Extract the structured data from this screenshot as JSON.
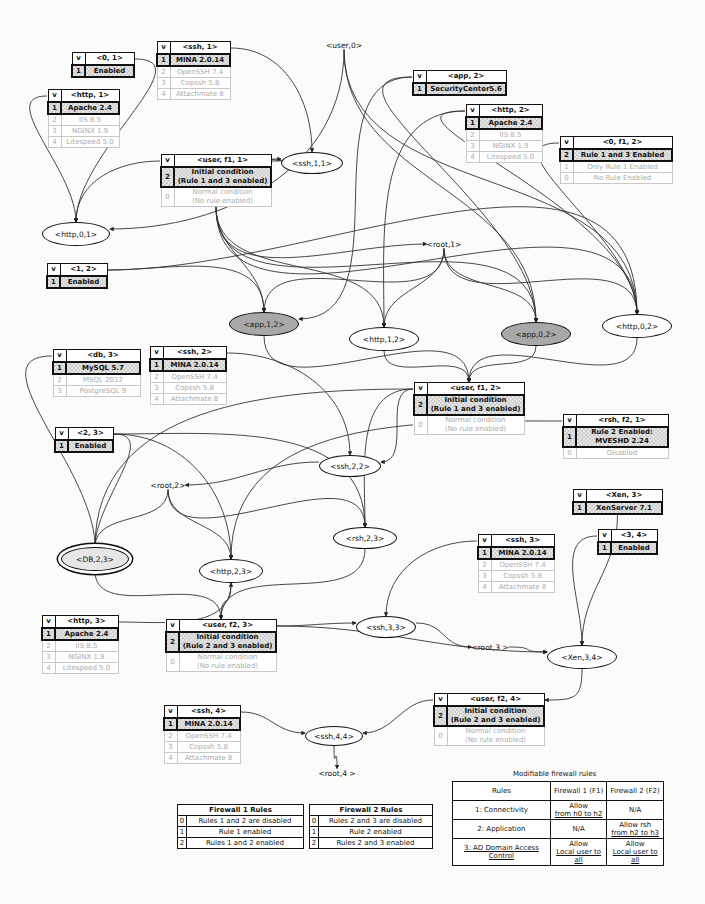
{
  "condition_tables": [
    {
      "id": "t01",
      "header": "<0, 1>",
      "x": 71,
      "y": 52,
      "w": 64,
      "rows": [
        {
          "idx": "1",
          "text": "Enabled",
          "selected": true
        }
      ]
    },
    {
      "id": "thttp1",
      "header": "<http, 1>",
      "x": 47,
      "y": 89,
      "w": 73,
      "rows": [
        {
          "idx": "1",
          "text": "Apache 2.4",
          "selected": true
        },
        {
          "idx": "2",
          "text": "IIS 8.5"
        },
        {
          "idx": "3",
          "text": "NGINX 1.9"
        },
        {
          "idx": "4",
          "text": "Litespeed 5.0"
        }
      ]
    },
    {
      "id": "tssh1",
      "header": "<ssh, 1>",
      "x": 156,
      "y": 41,
      "w": 75,
      "rows": [
        {
          "idx": "1",
          "text": "MINA 2.0.14",
          "selected": true
        },
        {
          "idx": "2",
          "text": "OpenSSH 7.4"
        },
        {
          "idx": "3",
          "text": "Copssh 5.8"
        },
        {
          "idx": "4",
          "text": "Attachmate 8"
        }
      ]
    },
    {
      "id": "tuserf11",
      "header": "<user, f1, 1>",
      "x": 160,
      "y": 154,
      "w": 112,
      "rows": [
        {
          "idx": "2",
          "text": "Initial condition\n(Rule 1 and 3 enabled)",
          "selected": true,
          "two": true
        },
        {
          "idx": "0",
          "text": "Normal condition\n(No rule enabled)",
          "two": true
        }
      ]
    },
    {
      "id": "tapp2",
      "header": "<app, 2>",
      "x": 412,
      "y": 70,
      "w": 95,
      "rows": [
        {
          "idx": "1",
          "text": "SecurityCenter5.6",
          "selected": true
        }
      ]
    },
    {
      "id": "thttp2",
      "header": "<http, 2>",
      "x": 465,
      "y": 104,
      "w": 78,
      "rows": [
        {
          "idx": "1",
          "text": "Apache 2.4",
          "selected": true
        },
        {
          "idx": "2",
          "text": "IIS 8.5"
        },
        {
          "idx": "3",
          "text": "NGINX 1.9"
        },
        {
          "idx": "4",
          "text": "Litespeed 5.0"
        }
      ]
    },
    {
      "id": "t0f12",
      "header": "<0, f1, 2>",
      "x": 559,
      "y": 136,
      "w": 114,
      "rows": [
        {
          "idx": "2",
          "text": "Rule 1 and 3 Enabled",
          "selected": true
        },
        {
          "idx": "1",
          "text": "Only Rule 1 Enabled"
        },
        {
          "idx": "0",
          "text": "No Rule Enabled"
        }
      ]
    },
    {
      "id": "t12",
      "header": "<1, 2>",
      "x": 46,
      "y": 263,
      "w": 62,
      "rows": [
        {
          "idx": "1",
          "text": "Enabled",
          "selected": true
        }
      ]
    },
    {
      "id": "tdb3",
      "header": "<db, 3>",
      "x": 52,
      "y": 349,
      "w": 89,
      "rows": [
        {
          "idx": "1",
          "text": "MySQL 5.7",
          "selected": true
        },
        {
          "idx": "2",
          "text": "MSQL 2012"
        },
        {
          "idx": "3",
          "text": "PostgreSQL 9"
        }
      ]
    },
    {
      "id": "tssh2",
      "header": "<ssh, 2>",
      "x": 149,
      "y": 346,
      "w": 78,
      "rows": [
        {
          "idx": "1",
          "text": "MINA 2.0.14",
          "selected": true
        },
        {
          "idx": "2",
          "text": "OpenSSH 7.4"
        },
        {
          "idx": "3",
          "text": "Copssh 5.8"
        },
        {
          "idx": "4",
          "text": "Attachmate 8"
        }
      ]
    },
    {
      "id": "tuserf12",
      "header": "<user, f1, 2>",
      "x": 413,
      "y": 382,
      "w": 112,
      "rows": [
        {
          "idx": "2",
          "text": "Initial condition\n(Rule 1 and 3 enabled)",
          "selected": true,
          "two": true
        },
        {
          "idx": "0",
          "text": "Normal condition\n(No rule enabled)",
          "two": true
        }
      ]
    },
    {
      "id": "trshf21",
      "header": "<rsh, f2, 1>",
      "x": 562,
      "y": 414,
      "w": 107,
      "rows": [
        {
          "idx": "1",
          "text": "Rule 2 Enabled:\nMVESHD 2.24",
          "selected": true,
          "two": true
        },
        {
          "idx": "0",
          "text": "Disabled"
        }
      ]
    },
    {
      "id": "t23",
      "header": "<2, 3>",
      "x": 54,
      "y": 427,
      "w": 60,
      "rows": [
        {
          "idx": "1",
          "text": "Enabled",
          "selected": true
        }
      ]
    },
    {
      "id": "txen3",
      "header": "<Xen, 3>",
      "x": 572,
      "y": 489,
      "w": 91,
      "rows": [
        {
          "idx": "1",
          "text": "XenServer 7.1",
          "selected": true
        }
      ]
    },
    {
      "id": "t34",
      "header": "<3, 4>",
      "x": 597,
      "y": 529,
      "w": 61,
      "rows": [
        {
          "idx": "1",
          "text": "Enabled",
          "selected": true
        }
      ]
    },
    {
      "id": "tssh3",
      "header": "<ssh, 3>",
      "x": 477,
      "y": 534,
      "w": 78,
      "rows": [
        {
          "idx": "1",
          "text": "MINA 2.0.14",
          "selected": true
        },
        {
          "idx": "2",
          "text": "OpenSSH 7.4"
        },
        {
          "idx": "3",
          "text": "Copssh 5.8"
        },
        {
          "idx": "4",
          "text": "Attachmate 8"
        }
      ]
    },
    {
      "id": "thttp3",
      "header": "<http, 3>",
      "x": 41,
      "y": 615,
      "w": 78,
      "rows": [
        {
          "idx": "1",
          "text": "Apache 2.4",
          "selected": true
        },
        {
          "idx": "2",
          "text": "IIS 8.5"
        },
        {
          "idx": "3",
          "text": "NGINX 1.9"
        },
        {
          "idx": "4",
          "text": "Litespeed 5.0"
        }
      ]
    },
    {
      "id": "tuserf23",
      "header": "<user, f2, 3>",
      "x": 165,
      "y": 619,
      "w": 112,
      "rows": [
        {
          "idx": "2",
          "text": "Initial condition\n(Rule 2 and 3 enabled)",
          "selected": true,
          "two": true
        },
        {
          "idx": "0",
          "text": "Normal condition\n(No rule enabled)",
          "two": true
        }
      ]
    },
    {
      "id": "tuserf24",
      "header": "<user, f2, 4>",
      "x": 433,
      "y": 693,
      "w": 112,
      "rows": [
        {
          "idx": "2",
          "text": "Initial condition\n(Rule 2 and 3 enabled)",
          "selected": true,
          "two": true
        },
        {
          "idx": "0",
          "text": "Normal condition\n(No rule enabled)",
          "two": true
        }
      ]
    },
    {
      "id": "tssh4",
      "header": "<ssh, 4>",
      "x": 163,
      "y": 705,
      "w": 78,
      "rows": [
        {
          "idx": "1",
          "text": "MINA 2.0.14",
          "selected": true
        },
        {
          "idx": "2",
          "text": "OpenSSH 7.4"
        },
        {
          "idx": "3",
          "text": "Copssh 5.8"
        },
        {
          "idx": "4",
          "text": "Attachmate 8"
        }
      ]
    }
  ],
  "nodes": [
    {
      "id": "http01",
      "label": "<http,0,1>",
      "x": 76,
      "y": 234,
      "w": 66,
      "h": 22,
      "style": "plain"
    },
    {
      "id": "ssh11",
      "label": "<ssh,1,1>",
      "x": 312,
      "y": 163,
      "w": 60,
      "h": 20,
      "style": "plain"
    },
    {
      "id": "app12",
      "label": "<app,1,2>",
      "x": 264,
      "y": 324,
      "w": 68,
      "h": 22,
      "style": "shaded"
    },
    {
      "id": "http12",
      "label": "<http,1,2>",
      "x": 384,
      "y": 339,
      "w": 68,
      "h": 22,
      "style": "plain"
    },
    {
      "id": "app02",
      "label": "<app,0,2>",
      "x": 536,
      "y": 334,
      "w": 68,
      "h": 22,
      "style": "shaded"
    },
    {
      "id": "http02",
      "label": "<http,0,2>",
      "x": 637,
      "y": 326,
      "w": 68,
      "h": 22,
      "style": "plain"
    },
    {
      "id": "ssh22",
      "label": "<ssh,2,2>",
      "x": 350,
      "y": 466,
      "w": 60,
      "h": 20,
      "style": "plain"
    },
    {
      "id": "rsh23",
      "label": "<rsh,2,3>",
      "x": 365,
      "y": 538,
      "w": 62,
      "h": 20,
      "style": "plain"
    },
    {
      "id": "db23",
      "label": "<DB,2,3>",
      "x": 95,
      "y": 559,
      "w": 66,
      "h": 22,
      "style": "double"
    },
    {
      "id": "http23",
      "label": "<http,2,3>",
      "x": 231,
      "y": 571,
      "w": 62,
      "h": 22,
      "style": "plain"
    },
    {
      "id": "ssh33",
      "label": "<ssh,3,3>",
      "x": 386,
      "y": 627,
      "w": 58,
      "h": 20,
      "style": "plain"
    },
    {
      "id": "xen34",
      "label": "<Xen,3,4>",
      "x": 582,
      "y": 657,
      "w": 68,
      "h": 22,
      "style": "plain"
    },
    {
      "id": "ssh44",
      "label": "<ssh,4,4>",
      "x": 334,
      "y": 736,
      "w": 56,
      "h": 18,
      "style": "plain"
    }
  ],
  "labels": [
    {
      "id": "user0",
      "label": "<user,0>",
      "x": 344,
      "y": 45
    },
    {
      "id": "root1",
      "label": "<root,1>",
      "x": 444,
      "y": 244
    },
    {
      "id": "root2",
      "label": "<root,2>",
      "x": 168,
      "y": 485
    },
    {
      "id": "root3",
      "label": "<root,3 >",
      "x": 490,
      "y": 647
    },
    {
      "id": "root4",
      "label": "<root,4 >",
      "x": 337,
      "y": 773
    }
  ],
  "firewall1_rules": {
    "title": "Firewall 1 Rules",
    "rows": [
      {
        "idx": "0",
        "text": "Rules 1 and 2 are disabled"
      },
      {
        "idx": "1",
        "text": "Rule 1 enabled"
      },
      {
        "idx": "2",
        "text": "Rules 1 and 2 enabled"
      }
    ]
  },
  "firewall2_rules": {
    "title": "Firewall 2 Rules",
    "rows": [
      {
        "idx": "0",
        "text": "Rules 2 and 3 are disabled"
      },
      {
        "idx": "1",
        "text": "Rule 2 enabled"
      },
      {
        "idx": "2",
        "text": "Rules 2 and 3 enabled"
      }
    ]
  },
  "modifiable_rules": {
    "title": "Modifiable firewall rules",
    "headers": [
      "Rules",
      "Firewall 1 (F1)",
      "Firewall 2 (F2)"
    ],
    "rows": [
      {
        "rule": "1: Connectivity",
        "f1_top": "Allow",
        "f1_bottom": "from h0 to h2",
        "f2_top": "N/A",
        "f2_bottom": ""
      },
      {
        "rule": "2: Application",
        "f1_top": "N/A",
        "f1_bottom": "",
        "f2_top": "Allow rsh",
        "f2_bottom": "from h2 to h3"
      },
      {
        "rule": "3: AD Domain Access Control",
        "f1_top": "Allow",
        "f1_bottom": "Local user to all",
        "f2_top": "Allow",
        "f2_bottom": "Local user to all"
      }
    ]
  },
  "edges": [
    [
      "tssh1:r",
      "ssh11:t"
    ],
    [
      "tuserf11:r",
      "ssh11:l"
    ],
    [
      "user0:b",
      "http01:r"
    ],
    [
      "user0:b",
      "app02:t"
    ],
    [
      "user0:b",
      "http02:t"
    ],
    [
      "t01:r",
      "http01:t"
    ],
    [
      "thttp1:l",
      "http01:t"
    ],
    [
      "tuserf11:l",
      "http01:t"
    ],
    [
      "tapp2:l",
      "app12:r"
    ],
    [
      "tapp2:l",
      "app02:t"
    ],
    [
      "thttp2:l",
      "http12:t"
    ],
    [
      "thttp2:l",
      "http02:t"
    ],
    [
      "t0f12:l",
      "http02:t"
    ],
    [
      "tuserf11:b",
      "app12:t"
    ],
    [
      "tuserf11:b",
      "http12:t"
    ],
    [
      "tuserf11:b",
      "app02:t"
    ],
    [
      "tuserf11:b",
      "http02:t"
    ],
    [
      "tuserf11:b",
      "root1:l"
    ],
    [
      "t12:r",
      "app12:t"
    ],
    [
      "t12:r",
      "http02:t"
    ],
    [
      "root1:b",
      "app12:t"
    ],
    [
      "root1:b",
      "http12:t"
    ],
    [
      "root1:b",
      "app02:t"
    ],
    [
      "root1:b",
      "http02:t"
    ],
    [
      "http12:b",
      "tuserf12:t"
    ],
    [
      "app02:b",
      "tuserf12:t"
    ],
    [
      "http02:b",
      "tuserf12:t"
    ],
    [
      "app12:b",
      "tuserf12:t"
    ],
    [
      "tuserf12:l",
      "ssh22:r"
    ],
    [
      "tuserf12:l",
      "db23:t"
    ],
    [
      "tuserf12:l",
      "rsh23:t"
    ],
    [
      "tssh2:r",
      "ssh22:t"
    ],
    [
      "ssh22:l",
      "root2:r"
    ],
    [
      "trshf21:l",
      "http23:t"
    ],
    [
      "t23:r",
      "db23:t"
    ],
    [
      "t23:r",
      "http23:t"
    ],
    [
      "t23:r",
      "rsh23:t"
    ],
    [
      "tdb3:l",
      "db23:t"
    ],
    [
      "root2:b",
      "db23:t"
    ],
    [
      "root2:b",
      "http23:t"
    ],
    [
      "root2:b",
      "rsh23:t"
    ],
    [
      "db23:b",
      "tuserf23:t"
    ],
    [
      "http23:b",
      "tuserf23:t"
    ],
    [
      "rsh23:b",
      "tuserf23:t"
    ],
    [
      "thttp3:r",
      "http23:b"
    ],
    [
      "tuserf23:r",
      "ssh33:l"
    ],
    [
      "tuserf23:r",
      "xen34:l"
    ],
    [
      "tssh3:l",
      "ssh33:t"
    ],
    [
      "ssh33:r",
      "root3:l"
    ],
    [
      "root3:r",
      "xen34:l"
    ],
    [
      "txen3:b",
      "xen34:t"
    ],
    [
      "t34:l",
      "xen34:t"
    ],
    [
      "xen34:b",
      "tuserf24:r"
    ],
    [
      "tuserf24:l",
      "ssh44:r"
    ],
    [
      "tssh4:r",
      "ssh44:l"
    ],
    [
      "ssh44:b",
      "root4:t"
    ]
  ]
}
